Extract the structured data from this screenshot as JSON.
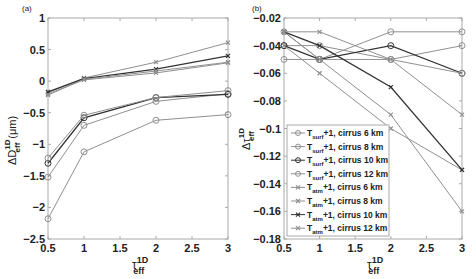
{
  "chart_data": [
    {
      "panel": "(a)",
      "type": "line",
      "title": "",
      "xlabel": "τ_eff^1D",
      "ylabel": "ΔD_eff^1D (μm)",
      "x": [
        0.5,
        1,
        2,
        3
      ],
      "xlim": [
        0.5,
        3
      ],
      "ylim": [
        -2.5,
        1
      ],
      "xticks": [
        "0.5",
        "1",
        "1.5",
        "2",
        "2.5",
        "3"
      ],
      "yticks": [
        "-2.5",
        "-2",
        "-1.5",
        "-1",
        "-0.5",
        "0",
        "0.5",
        "1"
      ],
      "grid": false,
      "series": [
        {
          "name": "T_surf+1, cirrus 6 km",
          "marker": "o",
          "color": "#909090",
          "values": [
            -2.18,
            -1.12,
            -0.62,
            -0.53
          ]
        },
        {
          "name": "T_surf+1, cirrus 8 km",
          "marker": "o",
          "color": "#909090",
          "values": [
            -1.52,
            -0.7,
            -0.32,
            -0.2
          ]
        },
        {
          "name": "T_surf+1, cirrus 10 km",
          "marker": "o",
          "color": "#333333",
          "values": [
            -1.3,
            -0.58,
            -0.26,
            -0.21
          ]
        },
        {
          "name": "T_surf+1, cirrus 12 km",
          "marker": "o",
          "color": "#909090",
          "values": [
            -1.22,
            -0.54,
            -0.26,
            -0.15
          ]
        },
        {
          "name": "T_atm+1, cirrus 6 km",
          "marker": "x",
          "color": "#909090",
          "values": [
            -0.2,
            0.02,
            0.13,
            0.29
          ]
        },
        {
          "name": "T_atm+1, cirrus 8 km",
          "marker": "x",
          "color": "#909090",
          "values": [
            -0.18,
            0.05,
            0.3,
            0.61
          ]
        },
        {
          "name": "T_atm+1, cirrus 10 km",
          "marker": "x",
          "color": "#333333",
          "values": [
            -0.17,
            0.04,
            0.19,
            0.4
          ]
        },
        {
          "name": "T_atm+1, cirrus 12 km",
          "marker": "x",
          "color": "#909090",
          "values": [
            -0.22,
            0.03,
            0.16,
            0.3
          ]
        }
      ],
      "legend": "none"
    },
    {
      "panel": "(b)",
      "type": "line",
      "title": "",
      "xlabel": "τ_eff^1D",
      "ylabel": "Δτ_eff^1D",
      "x": [
        0.5,
        1,
        2,
        3
      ],
      "xlim": [
        0.5,
        3
      ],
      "ylim": [
        -0.18,
        -0.02
      ],
      "xticks": [
        "0.5",
        "1",
        "1.5",
        "2",
        "2.5",
        "3"
      ],
      "yticks": [
        "-0.18",
        "-0.16",
        "-0.14",
        "-0.12",
        "-0.1",
        "-0.08",
        "-0.06",
        "-0.04",
        "-0.02"
      ],
      "grid": false,
      "series": [
        {
          "name": "T_surf+1, cirrus 6 km",
          "marker": "o",
          "color": "#909090",
          "values": [
            -0.05,
            -0.05,
            -0.03,
            -0.03
          ]
        },
        {
          "name": "T_surf+1, cirrus 8 km",
          "marker": "o",
          "color": "#909090",
          "values": [
            -0.04,
            -0.04,
            -0.05,
            -0.04
          ]
        },
        {
          "name": "T_surf+1, cirrus 10 km",
          "marker": "o",
          "color": "#333333",
          "values": [
            -0.04,
            -0.05,
            -0.04,
            -0.06
          ]
        },
        {
          "name": "T_surf+1, cirrus 12 km",
          "marker": "o",
          "color": "#909090",
          "values": [
            -0.03,
            -0.05,
            -0.05,
            -0.06
          ]
        },
        {
          "name": "T_atm+1, cirrus 6 km",
          "marker": "x",
          "color": "#909090",
          "values": [
            -0.04,
            -0.06,
            -0.1,
            -0.13
          ]
        },
        {
          "name": "T_atm+1, cirrus 8 km",
          "marker": "x",
          "color": "#909090",
          "values": [
            -0.03,
            -0.05,
            -0.09,
            -0.16
          ]
        },
        {
          "name": "T_atm+1, cirrus 10 km",
          "marker": "x",
          "color": "#333333",
          "values": [
            -0.03,
            -0.04,
            -0.07,
            -0.13
          ]
        },
        {
          "name": "T_atm+1, cirrus 12 km",
          "marker": "x",
          "color": "#909090",
          "values": [
            -0.03,
            -0.03,
            -0.05,
            -0.09
          ]
        }
      ],
      "legend": "lower left"
    }
  ],
  "labels": {
    "panel_a": "(a)",
    "panel_b": "(b)",
    "legend": [
      {
        "base": "T",
        "sub": "surf",
        "rest": "+1, cirrus 6 km"
      },
      {
        "base": "T",
        "sub": "surf",
        "rest": "+1, cirrus 8 km"
      },
      {
        "base": "T",
        "sub": "surf",
        "rest": "+1, cirrus 10 km"
      },
      {
        "base": "T",
        "sub": "surf",
        "rest": "+1, cirrus 12 km"
      },
      {
        "base": "T",
        "sub": "atm",
        "rest": "+1, cirrus 6 km"
      },
      {
        "base": "T",
        "sub": "atm",
        "rest": "+1, cirrus 8 km"
      },
      {
        "base": "T",
        "sub": "atm",
        "rest": "+1, cirrus 10 km"
      },
      {
        "base": "T",
        "sub": "atm",
        "rest": "+1, cirrus 12 km"
      }
    ],
    "xlabel_base": "τ",
    "xlabel_sup": "1D",
    "xlabel_sub": "eff",
    "ylabel_a_base": "ΔD",
    "ylabel_a_unit": "(μm)",
    "ylabel_b_base": "Δτ"
  }
}
